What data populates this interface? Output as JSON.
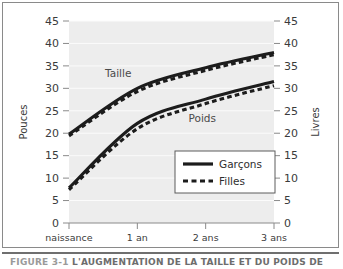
{
  "figure": {
    "caption_label": "FIGURE 3-1",
    "caption_title": "L'AUGMENTATION DE LA TAILLE ET DU POIDS  DE"
  },
  "chart_data": {
    "type": "line",
    "title": "",
    "xlabel": "",
    "ylabel": "Pouces",
    "ylabel_right": "Livres",
    "grid": true,
    "legend_position": "inside-lower-right",
    "x": [
      0,
      1,
      2,
      3
    ],
    "categories": [
      "naissance",
      "1 an",
      "2 ans",
      "3 ans"
    ],
    "xlim": [
      0,
      3
    ],
    "ylim": [
      0,
      45
    ],
    "yticks": [
      0,
      5,
      10,
      15,
      20,
      25,
      30,
      35,
      40,
      45
    ],
    "ytick_labels": [
      "0",
      "5",
      "10",
      "15",
      "20",
      "25",
      "30",
      "35",
      "40",
      "45"
    ],
    "ytick_labels_right": [
      "0",
      "5",
      "10",
      "15",
      "20",
      "25",
      "30",
      "35",
      "40",
      "45"
    ],
    "annotations": [
      {
        "text": "Taille",
        "x": 0.72,
        "y": 32.6
      },
      {
        "text": "Poids",
        "x": 1.95,
        "y": 22.4
      }
    ],
    "series": [
      {
        "name": "Taille — Garçons",
        "measure": "Taille",
        "group": "Garçons",
        "style": "solid",
        "unit": "Pouces",
        "values": [
          19.8,
          30.0,
          34.6,
          38.0
        ]
      },
      {
        "name": "Taille — Filles",
        "measure": "Taille",
        "group": "Filles",
        "style": "dashed",
        "unit": "Pouces",
        "values": [
          19.4,
          29.3,
          34.0,
          37.5
        ]
      },
      {
        "name": "Poids — Garçons",
        "measure": "Poids",
        "group": "Garçons",
        "style": "solid",
        "unit": "Livres",
        "values": [
          7.8,
          22.2,
          27.6,
          31.5
        ]
      },
      {
        "name": "Poids — Filles",
        "measure": "Poids",
        "group": "Filles",
        "style": "dashed",
        "unit": "Livres",
        "values": [
          7.4,
          21.0,
          26.6,
          30.6
        ]
      }
    ],
    "legend": [
      {
        "label": "Garçons",
        "style": "solid"
      },
      {
        "label": "Filles",
        "style": "dashed"
      }
    ],
    "colors": {
      "line": "#1c1c1c",
      "plot_background": "#ededed",
      "gridline": "#fbfbfb",
      "axis": "#8a8a8a",
      "text": "#3b3b3b"
    }
  }
}
